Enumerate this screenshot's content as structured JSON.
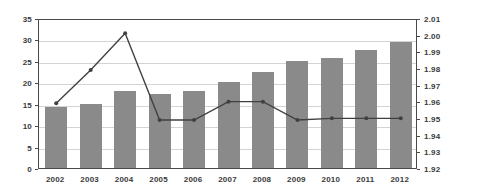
{
  "chart_data": {
    "type": "bar",
    "title": "",
    "subtitle": "",
    "xlabel": "",
    "ylabel": "",
    "categories": [
      "2002",
      "2003",
      "2004",
      "2005",
      "2006",
      "2007",
      "2008",
      "2009",
      "2010",
      "2011",
      "2012"
    ],
    "series": [
      {
        "name": "bars",
        "type": "bar",
        "axis": "left",
        "color": "#8a8a8a",
        "values": [
          14.2,
          15.0,
          18.0,
          17.2,
          18.0,
          20.1,
          22.5,
          25.0,
          25.7,
          27.6,
          29.5
        ]
      },
      {
        "name": "line",
        "type": "line",
        "axis": "right",
        "color": "#404040",
        "values": [
          1.96,
          1.98,
          2.002,
          1.95,
          1.95,
          1.961,
          1.961,
          1.95,
          1.951,
          1.951,
          1.951
        ]
      }
    ],
    "left_axis": {
      "min": 0,
      "max": 35,
      "step": 5,
      "ticks": [
        "0",
        "5",
        "10",
        "15",
        "20",
        "25",
        "30",
        "35"
      ]
    },
    "right_axis": {
      "min": 1.92,
      "max": 2.01,
      "step": 0.01,
      "ticks": [
        "1.92",
        "1.93",
        "1.94",
        "1.95",
        "1.96",
        "1.97",
        "1.98",
        "1.99",
        "2.00",
        "2.01"
      ]
    },
    "grid": true,
    "legend": "none",
    "colors": {
      "bar": "#8a8a8a",
      "line": "#404040",
      "grid": "#d3d3d3",
      "axis": "#4a4a4a",
      "text": "#3a3a3a",
      "background": "#ffffff"
    }
  }
}
